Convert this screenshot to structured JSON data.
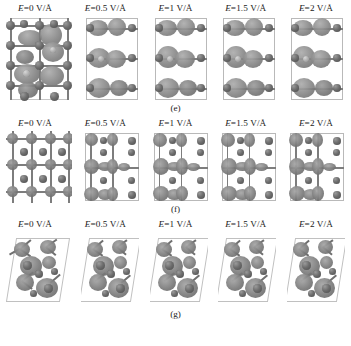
{
  "figure": {
    "field_unit": "V/Å",
    "field_symbol": "E",
    "columns": [
      {
        "label": "E=0 V/Å",
        "field_value": 0
      },
      {
        "label": "E=0.5 V/Å",
        "field_value": 0.5
      },
      {
        "label": "E=1 V/Å",
        "field_value": 1
      },
      {
        "label": "E=1.5 V/Å",
        "field_value": 1.5
      },
      {
        "label": "E=2 V/Å",
        "field_value": 2
      }
    ],
    "panels": [
      {
        "caption": "(e)",
        "view": "side-view",
        "col_labels": [
          "E=0 V/Å",
          "E=0.5 V/Å",
          "E=1 V/Å",
          "E=1.5 V/Å",
          "E=2 V/Å"
        ]
      },
      {
        "caption": "(f)",
        "view": "top-view",
        "col_labels": [
          "E=0 V/Å",
          "E=0.5 V/Å",
          "E=1 V/Å",
          "E=1.5 V/Å",
          "E=2 V/Å"
        ]
      },
      {
        "caption": "(g)",
        "view": "perspective-view",
        "col_labels": [
          "E=0 V/Å",
          "E=0.5 V/Å",
          "E=1 V/Å",
          "E=1.5 V/Å",
          "E=2 V/Å"
        ]
      }
    ],
    "colors": {
      "background": "#ffffff",
      "atom_dark": "#5a5a5a",
      "atom_light": "#b2b2b2",
      "isosurface": "#808080",
      "cell_frame": "#b9b9b9",
      "text": "#1a1a1a"
    }
  }
}
